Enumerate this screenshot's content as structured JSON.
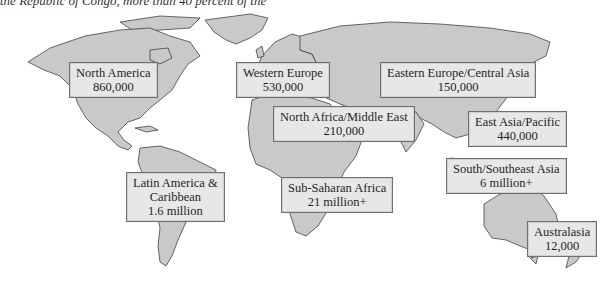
{
  "caption_fragment": "the Republic of Congo, more than 40 percent of the",
  "map": {
    "land_color": "#c9c9c9",
    "border_color": "#2d2d2d",
    "label_bg": "#e7e7e7",
    "regions": [
      {
        "name": "North America",
        "value": "860,000"
      },
      {
        "name": "Western Europe",
        "value": "530,000"
      },
      {
        "name": "Eastern Europe/Central Asia",
        "value": "150,000"
      },
      {
        "name": "North Africa/Middle East",
        "value": "210,000"
      },
      {
        "name": "East Asia/Pacific",
        "value": "440,000"
      },
      {
        "name": "Latin America &",
        "name2": "Caribbean",
        "value": "1.6 million"
      },
      {
        "name": "Sub-Saharan Africa",
        "value": "21 million+"
      },
      {
        "name": "South/Southeast Asia",
        "value": "6 million+"
      },
      {
        "name": "Australasia",
        "value": "12,000"
      }
    ]
  }
}
